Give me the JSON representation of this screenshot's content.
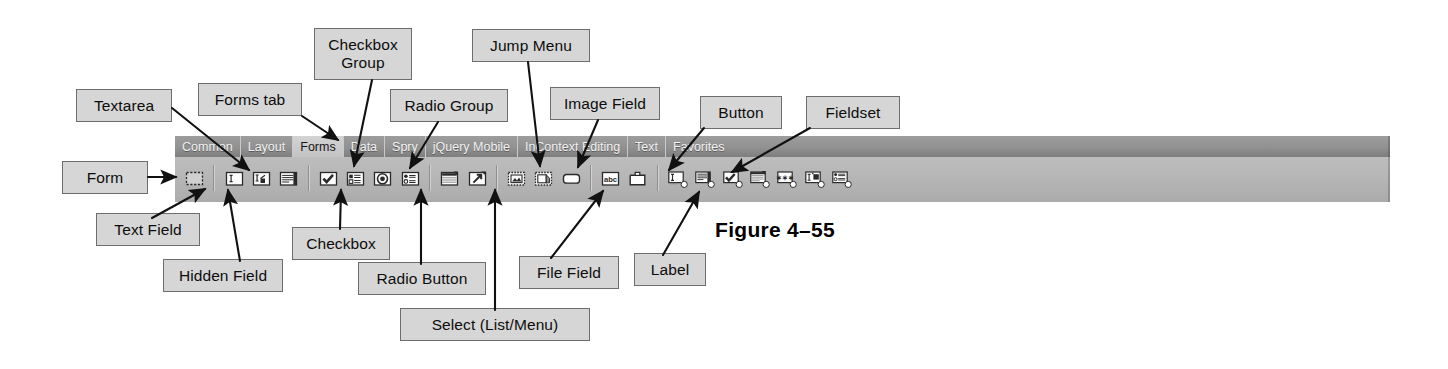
{
  "figure": {
    "caption": "Figure 4–55"
  },
  "toolbar": {
    "tabs": [
      {
        "label": "Common",
        "active": false
      },
      {
        "label": "Layout",
        "active": false
      },
      {
        "label": "Forms",
        "active": true
      },
      {
        "label": "Data",
        "active": false
      },
      {
        "label": "Spry",
        "active": false
      },
      {
        "label": "jQuery Mobile",
        "active": false
      },
      {
        "label": "InContext Editing",
        "active": false
      },
      {
        "label": "Text",
        "active": false
      },
      {
        "label": "Favorites",
        "active": false
      }
    ],
    "icons": [
      {
        "name": "form-icon",
        "title": "Form"
      },
      {
        "type": "divider"
      },
      {
        "name": "text-field-icon",
        "title": "Text Field"
      },
      {
        "name": "hidden-field-icon",
        "title": "Hidden Field"
      },
      {
        "name": "textarea-icon",
        "title": "Textarea"
      },
      {
        "type": "divider"
      },
      {
        "name": "checkbox-icon",
        "title": "Checkbox"
      },
      {
        "name": "checkbox-group-icon",
        "title": "Checkbox Group"
      },
      {
        "name": "radio-button-icon",
        "title": "Radio Button"
      },
      {
        "name": "radio-group-icon",
        "title": "Radio Group"
      },
      {
        "type": "divider"
      },
      {
        "name": "select-list-menu-icon",
        "title": "Select (List/Menu)"
      },
      {
        "name": "jump-menu-icon",
        "title": "Jump Menu"
      },
      {
        "type": "divider"
      },
      {
        "name": "image-field-icon",
        "title": "Image Field"
      },
      {
        "name": "file-field-icon",
        "title": "File Field"
      },
      {
        "name": "button-icon",
        "title": "Button"
      },
      {
        "type": "divider"
      },
      {
        "name": "label-icon",
        "title": "Label"
      },
      {
        "name": "fieldset-icon",
        "title": "Fieldset"
      },
      {
        "type": "divider"
      },
      {
        "name": "spry-text-field-icon",
        "title": "Spry Validation Text Field"
      },
      {
        "name": "spry-textarea-icon",
        "title": "Spry Validation Textarea"
      },
      {
        "name": "spry-checkbox-icon",
        "title": "Spry Validation Checkbox"
      },
      {
        "name": "spry-select-icon",
        "title": "Spry Validation Select"
      },
      {
        "name": "spry-password-icon",
        "title": "Spry Validation Password"
      },
      {
        "name": "spry-confirm-icon",
        "title": "Spry Validation Confirm"
      },
      {
        "name": "spry-radio-group-icon",
        "title": "Spry Validation Radio Group"
      }
    ]
  },
  "callouts": [
    {
      "id": "form",
      "label": "Form"
    },
    {
      "id": "textarea",
      "label": "Textarea"
    },
    {
      "id": "forms-tab",
      "label": "Forms tab"
    },
    {
      "id": "checkbox-group",
      "label": "Checkbox\nGroup"
    },
    {
      "id": "radio-group",
      "label": "Radio Group"
    },
    {
      "id": "jump-menu",
      "label": "Jump Menu"
    },
    {
      "id": "image-field",
      "label": "Image Field"
    },
    {
      "id": "button",
      "label": "Button"
    },
    {
      "id": "fieldset",
      "label": "Fieldset"
    },
    {
      "id": "text-field",
      "label": "Text Field"
    },
    {
      "id": "hidden-field",
      "label": "Hidden Field"
    },
    {
      "id": "checkbox",
      "label": "Checkbox"
    },
    {
      "id": "radio-button",
      "label": "Radio Button"
    },
    {
      "id": "select",
      "label": "Select (List/Menu)"
    },
    {
      "id": "file-field",
      "label": "File Field"
    },
    {
      "id": "label",
      "label": "Label"
    }
  ],
  "colors": {
    "callout_fill": "#d6d6d6",
    "callout_border": "#6d6d6d",
    "toolbar_tabbar": "#919191",
    "toolbar_body": "#b6b6b6",
    "active_tab": "#c9c9c9",
    "line": "#111111",
    "page_background": "#ffffff"
  }
}
